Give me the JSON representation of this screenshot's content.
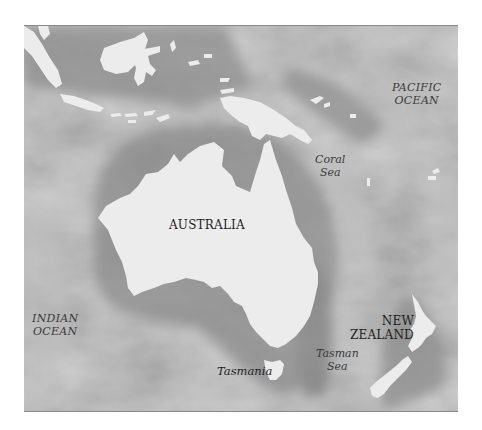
{
  "map": {
    "type": "relief map",
    "region": "Australia and New Zealand",
    "colors": {
      "land": "#ececec",
      "ocean_base": "#a3a3a3",
      "ocean_dark": "#8a8a8a",
      "ocean_light": "#b8b8b8",
      "label_text": "#2e2e2e"
    },
    "labels": {
      "pacific_ocean": [
        "PACIFIC",
        "OCEAN"
      ],
      "coral_sea": [
        "Coral",
        "Sea"
      ],
      "australia": "AUSTRALIA",
      "indian_ocean": [
        "INDIAN",
        "OCEAN"
      ],
      "new_zealand": [
        "NEW",
        "ZEALAND"
      ],
      "tasmania": "Tasmania",
      "tasman_sea": [
        "Tasman",
        "Sea"
      ]
    }
  }
}
